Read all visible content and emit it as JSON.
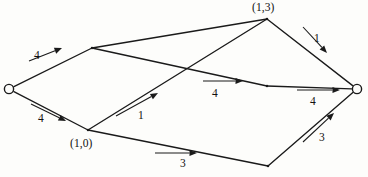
{
  "figure": {
    "type": "network-flow-diagram",
    "width": 368,
    "height": 177,
    "background_color": "#fdfdfb",
    "line_color": "#1a1a1a"
  },
  "nodes": [
    {
      "id": "source",
      "name": "source-node",
      "label": "",
      "x": 9,
      "y": 89,
      "shape": "circle"
    },
    {
      "id": "upper_left",
      "name": "upper-left-node",
      "label": "",
      "x": 92,
      "y": 48,
      "shape": "vertex"
    },
    {
      "id": "lower_left",
      "name": "lower-left-node",
      "label": "(1,0)",
      "x": 88,
      "y": 130,
      "shape": "vertex"
    },
    {
      "id": "top",
      "name": "top-node",
      "label": "(1,3)",
      "x": 267,
      "y": 19,
      "shape": "vertex"
    },
    {
      "id": "mid_right",
      "name": "middle-right-node",
      "label": "",
      "x": 267,
      "y": 86,
      "shape": "vertex"
    },
    {
      "id": "bottom",
      "name": "bottom-node",
      "label": "",
      "x": 268,
      "y": 166,
      "shape": "vertex"
    },
    {
      "id": "sink",
      "name": "sink-node",
      "label": "",
      "x": 357,
      "y": 89,
      "shape": "circle"
    }
  ],
  "node_labels": [
    {
      "name": "node-label-top",
      "text": "(1,3)",
      "x": 252,
      "y": 2
    },
    {
      "name": "node-label-lower-left",
      "text": "(1,0)",
      "x": 70,
      "y": 138
    }
  ],
  "edges": [
    {
      "id": "e1",
      "name": "edge-source-to-upper-left",
      "from": "source",
      "to": "upper_left",
      "weight": "4"
    },
    {
      "id": "e2",
      "name": "edge-source-to-lower-left",
      "from": "source",
      "to": "lower_left",
      "weight": "4"
    },
    {
      "id": "e3",
      "name": "edge-upper-left-to-top",
      "from": "upper_left",
      "to": "top",
      "weight": ""
    },
    {
      "id": "e4",
      "name": "edge-upper-left-to-mid",
      "from": "upper_left",
      "to": "mid_right",
      "weight": "4"
    },
    {
      "id": "e5",
      "name": "edge-lower-left-to-top",
      "from": "lower_left",
      "to": "top",
      "weight": "1"
    },
    {
      "id": "e6",
      "name": "edge-lower-left-to-bottom",
      "from": "lower_left",
      "to": "bottom",
      "weight": "3"
    },
    {
      "id": "e7",
      "name": "edge-top-to-sink",
      "from": "top",
      "to": "sink",
      "weight": "1"
    },
    {
      "id": "e8",
      "name": "edge-mid-to-sink",
      "from": "mid_right",
      "to": "sink",
      "weight": "4"
    },
    {
      "id": "e9",
      "name": "edge-bottom-to-sink",
      "from": "bottom",
      "to": "sink",
      "weight": "3"
    }
  ],
  "edge_weight_labels": [
    {
      "name": "edge-weight-source-upper-left",
      "text": "4",
      "x": 34,
      "y": 50
    },
    {
      "name": "edge-weight-source-lower-left",
      "text": "4",
      "x": 38,
      "y": 113
    },
    {
      "name": "edge-weight-lower-left-top",
      "text": "1",
      "x": 138,
      "y": 110
    },
    {
      "name": "edge-weight-upper-left-mid",
      "text": "4",
      "x": 212,
      "y": 88
    },
    {
      "name": "edge-weight-top-sink",
      "text": "1",
      "x": 314,
      "y": 33
    },
    {
      "name": "edge-weight-mid-sink",
      "text": "4",
      "x": 310,
      "y": 96
    },
    {
      "name": "edge-weight-lower-left-bottom",
      "text": "3",
      "x": 180,
      "y": 158
    },
    {
      "name": "edge-weight-bottom-sink",
      "text": "3",
      "x": 319,
      "y": 132
    }
  ],
  "flow_arrows": [
    {
      "name": "flow-arrow-source-upper-left",
      "x1": 29,
      "y1": 61,
      "x2": 62,
      "y2": 48
    },
    {
      "name": "flow-arrow-source-lower-left",
      "x1": 31,
      "y1": 104,
      "x2": 66,
      "y2": 121
    },
    {
      "name": "flow-arrow-lower-left-top",
      "x1": 116,
      "y1": 116,
      "x2": 158,
      "y2": 93
    },
    {
      "name": "flow-arrow-upper-left-mid",
      "x1": 203,
      "y1": 81,
      "x2": 243,
      "y2": 81
    },
    {
      "name": "flow-arrow-top-sink",
      "x1": 303,
      "y1": 27,
      "x2": 327,
      "y2": 53
    },
    {
      "name": "flow-arrow-mid-sink",
      "x1": 297,
      "y1": 90,
      "x2": 340,
      "y2": 90
    },
    {
      "name": "flow-arrow-lower-left-bottom",
      "x1": 155,
      "y1": 153,
      "x2": 197,
      "y2": 153
    },
    {
      "name": "flow-arrow-bottom-sink",
      "x1": 303,
      "y1": 142,
      "x2": 334,
      "y2": 113
    }
  ]
}
